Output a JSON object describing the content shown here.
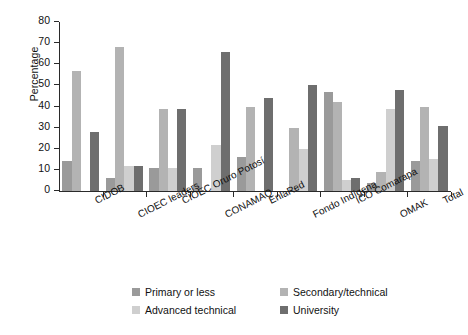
{
  "chart_data": {
    "type": "bar",
    "title": "",
    "subtitle": "",
    "xlabel": "",
    "ylabel": "Percentage",
    "ylim": [
      0,
      80
    ],
    "yticks": [
      0,
      10,
      20,
      30,
      40,
      50,
      60,
      70,
      80
    ],
    "ytick_labels": [
      "0",
      "10",
      "20",
      "30",
      "40",
      "50",
      "60",
      "70",
      "80"
    ],
    "grid": false,
    "legend_position": "bottom",
    "categories": [
      "CIDOB",
      "CIOEC leaders",
      "CIOEC Oruro Potosí",
      "CONAMAQ",
      "EnlaRed",
      "Fondo Indígena",
      "ICO Comarapa",
      "OMAK",
      "Total"
    ],
    "series": [
      {
        "name": "Primary or less",
        "color": "#9a9a9a",
        "values": [
          14,
          6,
          11,
          11,
          16,
          0,
          47,
          4,
          14
        ]
      },
      {
        "name": "Secondary/technical",
        "color": "#b3b3b3",
        "values": [
          57,
          68,
          39,
          0,
          40,
          30,
          42,
          9,
          40
        ]
      },
      {
        "name": "Advanced technical",
        "color": "#cfcfcf",
        "values": [
          0,
          12,
          11,
          22,
          0,
          20,
          5,
          39,
          15
        ]
      },
      {
        "name": "University",
        "color": "#6e6e6e",
        "values": [
          28,
          12,
          39,
          66,
          44,
          50,
          6,
          48,
          31
        ]
      }
    ]
  },
  "legend": {
    "items": [
      {
        "label": "Primary or less",
        "color": "#9a9a9a"
      },
      {
        "label": "Secondary/technical",
        "color": "#b3b3b3"
      },
      {
        "label": "Advanced technical",
        "color": "#cfcfcf"
      },
      {
        "label": "University",
        "color": "#6e6e6e"
      }
    ]
  },
  "axes": {
    "y_title": "Percentage"
  }
}
